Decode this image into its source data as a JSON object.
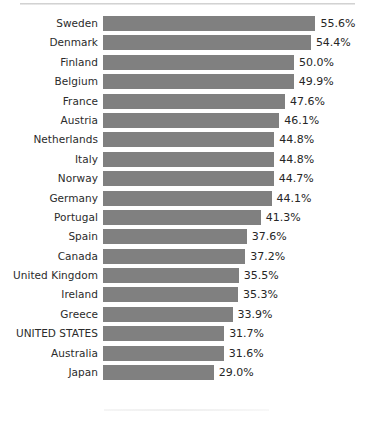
{
  "chart_data": {
    "type": "bar",
    "orientation": "horizontal",
    "title": "",
    "subtitle": "",
    "xlabel": "",
    "ylabel": "",
    "grid": false,
    "legend": null,
    "axis_visible": false,
    "tick_labels_visible": false,
    "value_labels_visible": true,
    "value_label_suffix": "%",
    "xlim": [
      0,
      56.0
    ],
    "bar_color": "#808080",
    "label_color": "#2b2b2b",
    "value_color": "#262626",
    "background": "#ffffff",
    "highlighted_category": "UNITED STATES",
    "categories": [
      "Sweden",
      "Denmark",
      "Finland",
      "Belgium",
      "France",
      "Austria",
      "Netherlands",
      "Italy",
      "Norway",
      "Germany",
      "Portugal",
      "Spain",
      "Canada",
      "United Kingdom",
      "Ireland",
      "Greece",
      "UNITED STATES",
      "Australia",
      "Japan"
    ],
    "values": [
      55.6,
      54.4,
      50.0,
      49.9,
      47.6,
      46.1,
      44.8,
      44.8,
      44.7,
      44.1,
      41.3,
      37.6,
      37.2,
      35.5,
      35.3,
      33.9,
      31.7,
      31.6,
      29.0
    ],
    "value_labels": [
      "55.6%",
      "54.4%",
      "50.0%",
      "49.9%",
      "47.6%",
      "46.1%",
      "44.8%",
      "44.8%",
      "44.7%",
      "44.1%",
      "41.3%",
      "37.6%",
      "37.2%",
      "35.5%",
      "35.3%",
      "33.9%",
      "31.7%",
      "31.6%",
      "29.0%"
    ],
    "rows": [
      {
        "category": "Sweden",
        "value": 55.6,
        "value_label": "55.6%"
      },
      {
        "category": "Denmark",
        "value": 54.4,
        "value_label": "54.4%"
      },
      {
        "category": "Finland",
        "value": 50.0,
        "value_label": "50.0%"
      },
      {
        "category": "Belgium",
        "value": 49.9,
        "value_label": "49.9%"
      },
      {
        "category": "France",
        "value": 47.6,
        "value_label": "47.6%"
      },
      {
        "category": "Austria",
        "value": 46.1,
        "value_label": "46.1%"
      },
      {
        "category": "Netherlands",
        "value": 44.8,
        "value_label": "44.8%"
      },
      {
        "category": "Italy",
        "value": 44.8,
        "value_label": "44.8%"
      },
      {
        "category": "Norway",
        "value": 44.7,
        "value_label": "44.7%"
      },
      {
        "category": "Germany",
        "value": 44.1,
        "value_label": "44.1%"
      },
      {
        "category": "Portugal",
        "value": 41.3,
        "value_label": "41.3%"
      },
      {
        "category": "Spain",
        "value": 37.6,
        "value_label": "37.6%"
      },
      {
        "category": "Canada",
        "value": 37.2,
        "value_label": "37.2%"
      },
      {
        "category": "United Kingdom",
        "value": 35.5,
        "value_label": "35.5%"
      },
      {
        "category": "Ireland",
        "value": 35.3,
        "value_label": "35.3%"
      },
      {
        "category": "Greece",
        "value": 33.9,
        "value_label": "33.9%"
      },
      {
        "category": "UNITED STATES",
        "value": 31.7,
        "value_label": "31.7%"
      },
      {
        "category": "Australia",
        "value": 31.6,
        "value_label": "31.6%"
      },
      {
        "category": "Japan",
        "value": 29.0,
        "value_label": "29.0%"
      }
    ]
  }
}
